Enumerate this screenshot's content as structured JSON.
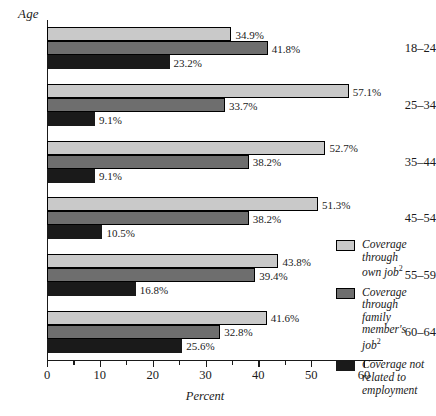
{
  "chart_data": {
    "type": "bar",
    "orientation": "horizontal",
    "title": "",
    "xlabel": "Percent",
    "ylabel": "Age",
    "xlim": [
      0,
      60
    ],
    "xticks": [
      0,
      10,
      20,
      30,
      40,
      50,
      60
    ],
    "xtick_labels": [
      "0",
      "10",
      "20",
      "30",
      "40",
      "50",
      "60"
    ],
    "minor_tick_interval": 5,
    "grid": false,
    "legend_position": "right",
    "categories": [
      "18–24",
      "25–34",
      "35–44",
      "45–54",
      "55–59",
      "60–64"
    ],
    "series": [
      {
        "name": "Coverage through own job",
        "footnote": "2",
        "color": "#c9c9c9",
        "values": [
          34.9,
          57.1,
          52.7,
          51.3,
          43.8,
          41.6
        ],
        "labels": [
          "34.9%",
          "57.1%",
          "52.7%",
          "51.3%",
          "43.8%",
          "41.6%"
        ]
      },
      {
        "name": "Coverage through family member's job",
        "footnote": "2",
        "color": "#6e6e6e",
        "values": [
          41.8,
          33.7,
          38.2,
          38.2,
          39.4,
          32.8
        ],
        "labels": [
          "41.8%",
          "33.7%",
          "38.2%",
          "38.2%",
          "39.4%",
          "32.8%"
        ]
      },
      {
        "name": "Coverage not related to employment",
        "footnote": "",
        "color": "#1a1a1a",
        "values": [
          23.2,
          9.1,
          9.1,
          10.5,
          16.8,
          25.6
        ],
        "labels": [
          "23.2%",
          "9.1%",
          "9.1%",
          "10.5%",
          "16.8%",
          "25.6%"
        ]
      }
    ]
  },
  "axis": {
    "y_title": "Age",
    "x_title": "Percent"
  },
  "legend": {
    "items": [
      {
        "line1": "Coverage through",
        "line2": "own job",
        "sup": "2",
        "line3": ""
      },
      {
        "line1": "Coverage through",
        "line2": "family member's",
        "sup": "2",
        "line3": "job"
      },
      {
        "line1": "Coverage not",
        "line2": "related to",
        "sup": "",
        "line3": "employment"
      }
    ]
  }
}
